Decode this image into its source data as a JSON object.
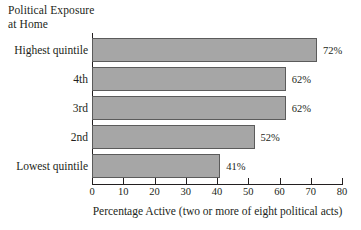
{
  "chart_data": {
    "type": "bar",
    "orientation": "horizontal",
    "title": "Political Exposure\nat Home",
    "xlabel": "Percentage Active (two or more of eight political acts)",
    "ylabel": "",
    "categories": [
      "Highest quintile",
      "4th",
      "3rd",
      "2nd",
      "Lowest quintile"
    ],
    "values": [
      72,
      62,
      62,
      52,
      41
    ],
    "value_labels": [
      "72%",
      "62%",
      "62%",
      "52%",
      "41%"
    ],
    "xlim": [
      0,
      80
    ],
    "xticks": [
      0,
      10,
      20,
      30,
      40,
      50,
      60,
      70,
      80
    ],
    "xtick_labels": [
      "0",
      "10",
      "20",
      "30",
      "40",
      "50",
      "60",
      "70",
      "80"
    ],
    "grid": false,
    "legend": null,
    "bar_fill_color": "#a6a6a6",
    "bar_border_color": "#5b5b5b",
    "axis_color": "#231f20",
    "background_color": "#ffffff"
  }
}
